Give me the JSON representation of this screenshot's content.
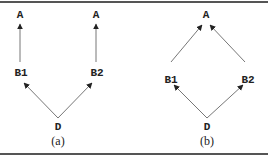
{
  "figure": {
    "panels": [
      {
        "caption": "(a)",
        "nodes": [
          {
            "id": "A_left",
            "label": "A"
          },
          {
            "id": "A_right",
            "label": "A"
          },
          {
            "id": "B1",
            "label": "B1"
          },
          {
            "id": "B2",
            "label": "B2"
          },
          {
            "id": "D",
            "label": "D"
          }
        ],
        "edges": [
          {
            "from": "B1",
            "to": "A_left"
          },
          {
            "from": "B2",
            "to": "A_right"
          },
          {
            "from": "D",
            "to": "B1"
          },
          {
            "from": "D",
            "to": "B2"
          }
        ]
      },
      {
        "caption": "(b)",
        "nodes": [
          {
            "id": "A",
            "label": "A"
          },
          {
            "id": "B1",
            "label": "B1"
          },
          {
            "id": "B2",
            "label": "B2"
          },
          {
            "id": "D",
            "label": "D"
          }
        ],
        "edges": [
          {
            "from": "B1",
            "to": "A"
          },
          {
            "from": "B2",
            "to": "A"
          },
          {
            "from": "D",
            "to": "B1"
          },
          {
            "from": "D",
            "to": "B2"
          }
        ]
      }
    ],
    "colors": {
      "line": "#777777",
      "text": "#222222",
      "rule": "#555555"
    }
  }
}
